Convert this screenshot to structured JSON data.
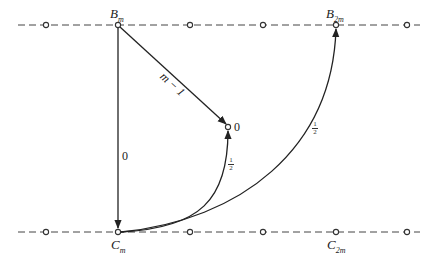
{
  "diagram": {
    "type": "directed graph between two dashed lattice lines",
    "top_line": {
      "y": 25,
      "nodes_x": [
        46,
        118,
        190,
        263,
        336,
        407
      ],
      "labels": [
        {
          "node_index": 1,
          "main": "B",
          "sub": "m"
        },
        {
          "node_index": 4,
          "main": "B",
          "sub": "2m"
        }
      ]
    },
    "bottom_line": {
      "y": 232,
      "nodes_x": [
        46,
        118,
        190,
        263,
        336,
        407
      ],
      "labels": [
        {
          "node_index": 1,
          "main": "C",
          "sub": "m"
        },
        {
          "node_index": 4,
          "main": "C",
          "sub": "2m"
        }
      ]
    },
    "middle_node": {
      "x": 229,
      "y": 127,
      "label": "0"
    },
    "edges": [
      {
        "from": "B_m",
        "to": "C_m",
        "weight": "0"
      },
      {
        "from": "B_m",
        "to": "middle",
        "weight": "m − 1"
      },
      {
        "from": "C_m",
        "to": "middle",
        "weight": "1/2",
        "weight_num": "1",
        "weight_den": "2"
      },
      {
        "from": "C_m",
        "to": "B_2m",
        "weight": "1/2",
        "weight_num": "1",
        "weight_den": "2"
      }
    ]
  }
}
